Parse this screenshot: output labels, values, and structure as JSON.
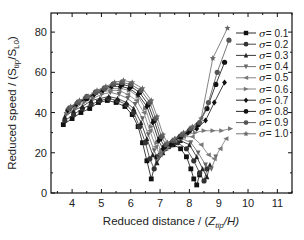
{
  "chart_data": {
    "type": "line",
    "title": "",
    "xlabel": "Reduced distance / (Z_tip/H)",
    "xlabel_parts": {
      "main": "Reduced distance / (",
      "var": "Z",
      "sub": "tip",
      "rest": "/H)"
    },
    "ylabel": "Reduced speed / (S_tip/S_L0)",
    "ylabel_parts": {
      "main": "Reduced speed / (S",
      "sub1": "tip",
      "mid": "/S",
      "sub2": "L0",
      "rest": ")"
    },
    "xlim": [
      3.28,
      11.5
    ],
    "ylim": [
      0,
      89.5
    ],
    "xticks": [
      4,
      5,
      6,
      7,
      8,
      9,
      10,
      11
    ],
    "yticks": [
      0,
      20,
      40,
      60,
      80
    ],
    "grid": false,
    "legend_position": "upper right",
    "series": [
      {
        "name": "σ = 0.1",
        "marker": "square",
        "color": "#111111",
        "x": [
          3.7,
          4.0,
          4.3,
          4.6,
          4.9,
          5.2,
          5.5,
          5.8,
          6.05,
          6.25,
          6.4,
          6.55,
          6.7,
          6.9,
          7.15,
          7.45,
          7.7,
          7.9,
          8.05,
          8.15,
          8.25,
          8.35
        ],
        "y": [
          34,
          37,
          40,
          42,
          45,
          46,
          45,
          43,
          39,
          33,
          25,
          16,
          7,
          18,
          22,
          24,
          22,
          18,
          12,
          7,
          4,
          9
        ]
      },
      {
        "name": "σ = 0.2",
        "marker": "circle",
        "color": "#333333",
        "x": [
          3.75,
          4.05,
          4.35,
          4.65,
          4.95,
          5.25,
          5.55,
          5.85,
          6.1,
          6.3,
          6.5,
          6.65,
          6.8,
          7.0,
          7.3,
          7.6,
          7.9,
          8.15,
          8.35,
          8.5,
          8.6
        ],
        "y": [
          36,
          39,
          42,
          44,
          46,
          47,
          46,
          44,
          40,
          33,
          25,
          17,
          12,
          19,
          23,
          25,
          22,
          16,
          10,
          6,
          12
        ]
      },
      {
        "name": "σ = 0.3",
        "marker": "triangle-up",
        "color": "#222222",
        "x": [
          3.75,
          4.05,
          4.35,
          4.65,
          4.95,
          5.25,
          5.55,
          5.85,
          6.1,
          6.35,
          6.55,
          6.75,
          6.9,
          7.1,
          7.4,
          7.7,
          8.0,
          8.25,
          8.45,
          8.6,
          8.7
        ],
        "y": [
          38,
          41,
          43,
          46,
          47,
          48,
          47,
          45,
          42,
          35,
          27,
          19,
          15,
          20,
          24,
          26,
          24,
          18,
          12,
          8,
          14
        ]
      },
      {
        "name": "σ = 0.4",
        "marker": "triangle-down",
        "color": "#666666",
        "x": [
          3.8,
          4.1,
          4.4,
          4.7,
          5.0,
          5.3,
          5.6,
          5.9,
          6.15,
          6.4,
          6.6,
          6.8,
          6.95,
          7.15,
          7.45,
          7.75,
          8.05,
          8.3,
          8.55,
          8.75,
          8.9
        ],
        "y": [
          39,
          42,
          45,
          47,
          49,
          50,
          49,
          47,
          44,
          37,
          29,
          21,
          17,
          21,
          25,
          27,
          25,
          20,
          14,
          12,
          18
        ]
      },
      {
        "name": "σ = 0.5",
        "marker": "triangle-left",
        "color": "#777777",
        "x": [
          3.8,
          4.1,
          4.4,
          4.7,
          5.0,
          5.3,
          5.6,
          5.9,
          6.2,
          6.45,
          6.65,
          6.85,
          7.0,
          7.2,
          7.5,
          7.8,
          8.1,
          8.4,
          8.65,
          8.85,
          9.05,
          9.25
        ],
        "y": [
          40,
          43,
          46,
          48,
          50,
          51,
          51,
          49,
          46,
          40,
          31,
          23,
          19,
          22,
          26,
          28,
          28,
          24,
          19,
          17,
          22,
          27
        ]
      },
      {
        "name": "σ = 0.6",
        "marker": "triangle-right",
        "color": "#777777",
        "x": [
          3.85,
          4.15,
          4.45,
          4.75,
          5.05,
          5.35,
          5.65,
          5.95,
          6.25,
          6.5,
          6.7,
          6.9,
          7.05,
          7.3,
          7.6,
          7.9,
          8.2,
          8.5,
          8.8,
          9.1,
          9.4
        ],
        "y": [
          41,
          44,
          47,
          49,
          51,
          52,
          52,
          51,
          48,
          42,
          33,
          25,
          21,
          23,
          27,
          29,
          30,
          31,
          31,
          31,
          32
        ]
      },
      {
        "name": "σ = 0.7",
        "marker": "diamond",
        "color": "#111111",
        "x": [
          3.85,
          4.15,
          4.45,
          4.75,
          5.05,
          5.35,
          5.65,
          5.95,
          6.25,
          6.55,
          6.75,
          6.95,
          7.1,
          7.35,
          7.65,
          7.95,
          8.25,
          8.55,
          8.85,
          9.2
        ],
        "y": [
          41,
          44,
          47,
          49,
          51,
          53,
          53,
          52,
          49,
          43,
          35,
          26,
          22,
          24,
          28,
          30,
          32,
          36,
          45,
          55
        ]
      },
      {
        "name": "σ = 0.8",
        "marker": "circle",
        "color": "#111111",
        "x": [
          3.9,
          4.2,
          4.5,
          4.8,
          5.1,
          5.4,
          5.7,
          6.0,
          6.3,
          6.6,
          6.8,
          7.0,
          7.15,
          7.4,
          7.7,
          8.0,
          8.3,
          8.6,
          8.9,
          9.2
        ],
        "y": [
          42,
          45,
          47,
          50,
          52,
          54,
          54,
          53,
          50,
          44,
          36,
          27,
          23,
          25,
          28,
          31,
          34,
          42,
          54,
          65
        ]
      },
      {
        "name": "σ = 0.9",
        "marker": "circle",
        "color": "#555555",
        "x": [
          3.9,
          4.2,
          4.5,
          4.8,
          5.1,
          5.4,
          5.7,
          6.0,
          6.35,
          6.65,
          6.85,
          7.05,
          7.2,
          7.45,
          7.75,
          8.05,
          8.35,
          8.65,
          8.95,
          9.35
        ],
        "y": [
          42,
          45,
          48,
          50,
          52,
          54,
          55,
          54,
          51,
          45,
          37,
          28,
          24,
          26,
          29,
          32,
          35,
          45,
          60,
          76
        ]
      },
      {
        "name": "σ = 1.0",
        "marker": "star",
        "color": "#666666",
        "x": [
          3.95,
          4.25,
          4.55,
          4.85,
          5.15,
          5.45,
          5.75,
          6.05,
          6.4,
          6.7,
          6.9,
          7.1,
          7.25,
          7.5,
          7.8,
          8.1,
          8.4,
          8.8,
          9.3
        ],
        "y": [
          43,
          46,
          48,
          51,
          53,
          55,
          56,
          55,
          52,
          46,
          38,
          29,
          25,
          27,
          30,
          33,
          37,
          67,
          82
        ]
      }
    ]
  },
  "legend": {
    "items": [
      {
        "prefix": "σ",
        "label": "= 0.1"
      },
      {
        "prefix": "σ",
        "label": "= 0.2"
      },
      {
        "prefix": "σ",
        "label": "= 0.3"
      },
      {
        "prefix": "σ",
        "label": "= 0.4"
      },
      {
        "prefix": "σ",
        "label": "= 0.5"
      },
      {
        "prefix": "σ",
        "label": "= 0.6"
      },
      {
        "prefix": "σ",
        "label": "= 0.7"
      },
      {
        "prefix": "σ",
        "label": "= 0.8"
      },
      {
        "prefix": "σ",
        "label": "= 0.9"
      },
      {
        "prefix": "σ",
        "label": "= 1.0"
      }
    ]
  }
}
